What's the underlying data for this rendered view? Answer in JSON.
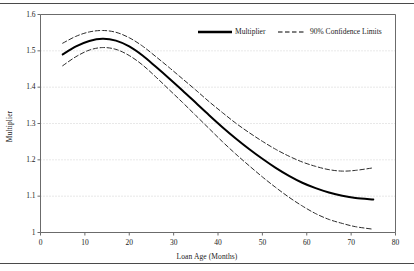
{
  "chart_data": {
    "type": "line",
    "title": "",
    "xlabel": "Loan Age (Months)",
    "ylabel": "Multiplier",
    "xlim": [
      0,
      80
    ],
    "ylim": [
      1,
      1.6
    ],
    "xticks": [
      "0",
      "10",
      "20",
      "30",
      "40",
      "50",
      "60",
      "70",
      "80"
    ],
    "yticks": [
      "1",
      "1.1",
      "1.2",
      "1.3",
      "1.4",
      "1.5",
      "1.6"
    ],
    "grid": "horizontal-dotted",
    "legend_position": "top-right-inside",
    "series": [
      {
        "name": "Multiplier",
        "style": "solid",
        "color": "#000000",
        "width": 2.0,
        "x": [
          5,
          8,
          11,
          14,
          17,
          20,
          23,
          26,
          29,
          32,
          35,
          38,
          41,
          44,
          47,
          50,
          53,
          56,
          59,
          62,
          65,
          68,
          71,
          75
        ],
        "values": [
          1.49,
          1.512,
          1.527,
          1.533,
          1.528,
          1.512,
          1.487,
          1.456,
          1.424,
          1.391,
          1.357,
          1.323,
          1.29,
          1.259,
          1.23,
          1.203,
          1.178,
          1.156,
          1.137,
          1.122,
          1.11,
          1.101,
          1.095,
          1.091
        ]
      },
      {
        "name": "90% Confidence Limits Upper",
        "style": "dashed",
        "color": "#2b2b2b",
        "width": 1.0,
        "x": [
          5,
          8,
          11,
          14,
          17,
          20,
          23,
          26,
          29,
          32,
          35,
          38,
          41,
          44,
          47,
          50,
          53,
          56,
          59,
          62,
          65,
          68,
          71,
          75
        ],
        "values": [
          1.521,
          1.54,
          1.552,
          1.556,
          1.551,
          1.536,
          1.513,
          1.484,
          1.454,
          1.423,
          1.392,
          1.36,
          1.33,
          1.301,
          1.275,
          1.251,
          1.229,
          1.21,
          1.194,
          1.182,
          1.173,
          1.169,
          1.171,
          1.178
        ]
      },
      {
        "name": "90% Confidence Limits Lower",
        "style": "dashed",
        "color": "#2b2b2b",
        "width": 1.0,
        "x": [
          5,
          8,
          11,
          14,
          17,
          20,
          23,
          26,
          29,
          32,
          35,
          38,
          41,
          44,
          47,
          50,
          53,
          56,
          59,
          62,
          65,
          68,
          71,
          75
        ],
        "values": [
          1.459,
          1.484,
          1.502,
          1.509,
          1.504,
          1.487,
          1.461,
          1.428,
          1.393,
          1.358,
          1.322,
          1.286,
          1.25,
          1.216,
          1.184,
          1.153,
          1.124,
          1.097,
          1.073,
          1.052,
          1.036,
          1.025,
          1.016,
          1.009
        ]
      }
    ],
    "legend": [
      {
        "label": "Multiplier",
        "style": "solid"
      },
      {
        "label": "90% Confidence Limits",
        "style": "dashed"
      }
    ]
  }
}
